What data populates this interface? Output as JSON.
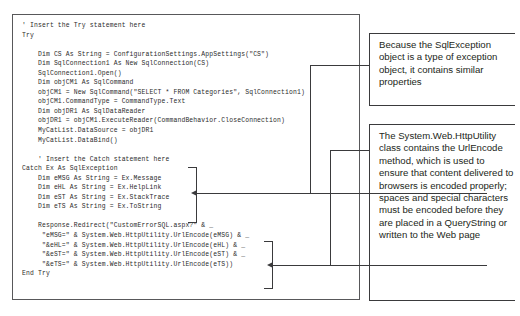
{
  "figure": {
    "kind": "annotated-code-listing",
    "language": "Visual Basic .NET"
  },
  "code_box": {
    "name": "vb-try-catch-listing",
    "lines": [
      "' Insert the Try statement here",
      "Try",
      "",
      "    Dim CS As String = ConfigurationSettings.AppSettings(\"CS\")",
      "    Dim SqlConnection1 As New SqlConnection(CS)",
      "    SqlConnection1.Open()",
      "    Dim objCM1 As SqlCommand",
      "    objCM1 = New SqlCommand(\"SELECT * FROM Categories\", SqlConnection1)",
      "    objCM1.CommandType = CommandType.Text",
      "    Dim objDR1 As SqlDataReader",
      "    objDR1 = objCM1.ExecuteReader(CommandBehavior.CloseConnection)",
      "    MyCatList.DataSource = objDR1",
      "    MyCatList.DataBind()",
      "",
      "    ' Insert the Catch statement here",
      "Catch Ex As SqlException",
      "    Dim eMSG As String = Ex.Message",
      "    Dim eHL As String = Ex.HelpLink",
      "    Dim eST As String = Ex.StackTrace",
      "    Dim eTS As String = Ex.ToString",
      "",
      "    Response.Redirect(\"CustomErrorSQL.aspx?\" & _",
      "     \"eMSG=\" & System.Web.HttpUtility.UrlEncode(eMSG) & _",
      "     \"&eHL=\" & System.Web.HttpUtility.UrlEncode(eHL) & _",
      "     \"&eST=\" & System.Web.HttpUtility.UrlEncode(eST) & _",
      "     \"&eTS=\" & System.Web.HttpUtility.UrlEncode(eTS))",
      "End Try"
    ]
  },
  "callouts": [
    {
      "id": "sql-exception-note",
      "text": "Because the SqlException object is a type of exception object, it contains similar properties",
      "points_to": "Catch Ex As SqlException property block"
    },
    {
      "id": "httputility-note",
      "text": "The System.Web.HttpUtility class contains the UrlEncode method, which is used to ensure that content delivered to browsers is encoded properly; spaces and special characters must be encoded before they are placed in a QueryString or written to the Web page",
      "points_to": "Response.Redirect UrlEncode block"
    }
  ],
  "colors": {
    "code_text": "#2b2b2b",
    "callout_text": "#231f20",
    "rule": "#3a3a3c",
    "box_border": "#58585a",
    "background": "#ffffff"
  }
}
